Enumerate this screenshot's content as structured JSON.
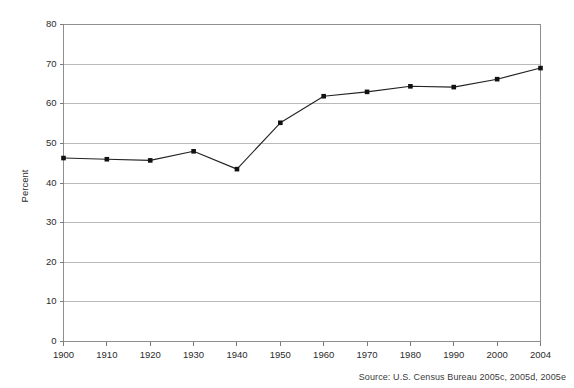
{
  "chart_data": {
    "type": "line",
    "title": "",
    "subtitle": "",
    "xlabel": "",
    "ylabel": "Percent",
    "x": [
      1900,
      1910,
      1920,
      1930,
      1940,
      1950,
      1960,
      1970,
      1980,
      1990,
      2000,
      2004
    ],
    "categories": [
      "1900",
      "1910",
      "1920",
      "1930",
      "1940",
      "1950",
      "1960",
      "1970",
      "1980",
      "1990",
      "2000",
      "2004"
    ],
    "values": [
      46.3,
      46.0,
      45.7,
      48.0,
      43.5,
      55.2,
      61.9,
      63.0,
      64.4,
      64.2,
      66.2,
      69.0
    ],
    "series": [
      {
        "name": "Percent",
        "values": [
          46.3,
          46.0,
          45.7,
          48.0,
          43.5,
          55.2,
          61.9,
          63.0,
          64.4,
          64.2,
          66.2,
          69.0
        ]
      }
    ],
    "ylim": [
      0,
      80
    ],
    "yticks": [
      0,
      10,
      20,
      30,
      40,
      50,
      60,
      70,
      80
    ],
    "ytick_labels": [
      "0",
      "10",
      "20",
      "30",
      "40",
      "50",
      "60",
      "70",
      "80"
    ],
    "xtick_labels": [
      "1900",
      "1910",
      "1920",
      "1930",
      "1940",
      "1950",
      "1960",
      "1970",
      "1980",
      "1990",
      "2000",
      "2004"
    ],
    "grid": "horizontal",
    "legend": "none",
    "marker": "square",
    "line_color": "#232323",
    "marker_color": "#111111",
    "grid_color": "#a8a8a8",
    "background_color": "#ffffff"
  },
  "source_note": "Source: U.S. Census Bureau 2005c, 2005d, 2005e"
}
